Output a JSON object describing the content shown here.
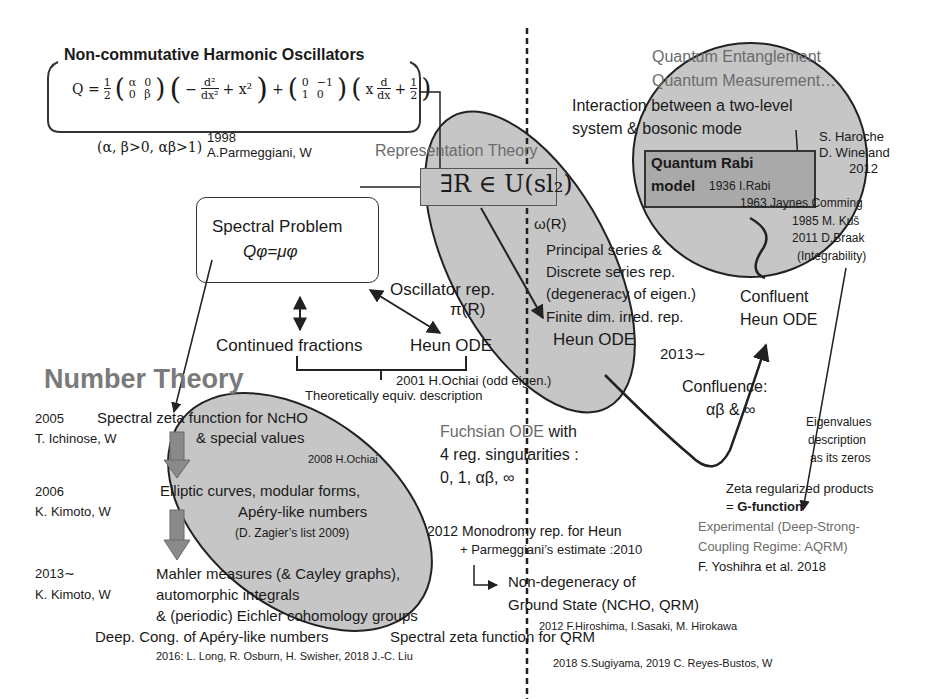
{
  "colors": {
    "ellipse_fill": "#c6c6c6",
    "rabi_box_fill": "#a9a9a9",
    "gray_text": "#6b6b6b",
    "number_theory_heading": "#7a7a7a",
    "down_arrow": "#8a8a8a",
    "line": "#222222"
  },
  "ncho": {
    "title": "Non-commutative Harmonic Oscillators",
    "formula": "Q = ½(α 0; 0 β)(−d²/dx² + x²) + (0 −1; 1 0)(x d/dx + ½)",
    "formula_q": "Q =",
    "formula_half": "1",
    "formula_half_den": "2",
    "matrix1": [
      "α",
      "0",
      "0",
      "β"
    ],
    "term1": "−",
    "term1_num": "d²",
    "term1_den": "dx²",
    "term1_tail": "+ x²",
    "plus": "+",
    "matrix2": [
      "0",
      "−1",
      "1",
      "0"
    ],
    "term2_x": "x",
    "term2_num": "d",
    "term2_den": "dx",
    "term2_plus": "+",
    "term2_half_num": "1",
    "term2_half_den": "2",
    "conditions": "(α, β>0, αβ>1)",
    "year": "1998",
    "authors": "A.Parmeggiani, W"
  },
  "representation": {
    "heading": "Representation Theory",
    "element": "∃R ∈ U(sl₂)",
    "omega": "ω(R)",
    "items": [
      "Principal series &",
      "Discrete series rep.",
      "(degeneracy of eigen.)",
      "Finite dim. irred. rep."
    ],
    "heun": "Heun ODE"
  },
  "spectral": {
    "title": "Spectral Problem",
    "equation": "Qφ=μφ",
    "oscillator_rep": "Oscillator rep.",
    "pi_r": "π(R)",
    "continued_fractions": "Continued fractions",
    "heun": "Heun ODE",
    "ochiai_2001": "2001 H.Ochiai (odd eigen.)",
    "equiv": "Theoretically equiv. description"
  },
  "quantum": {
    "entanglement": "Quantum Entanglement",
    "measurement": "Quantum Measurement…",
    "interaction_1": "Interaction between a two-level",
    "interaction_2": "system & bosonic mode",
    "nobel_1": "S. Haroche",
    "nobel_2": "D. Wineland",
    "nobel_year": "2012",
    "rabi_title_1": "Quantum Rabi",
    "rabi_title_2": "model",
    "rabi_1936": "1936 I.Rabi",
    "history": [
      "1963 Jaynes Comming",
      "1985 M. Kuš",
      "2011 D.Braak",
      "(Integrability)"
    ],
    "confluent_1": "Confluent",
    "confluent_2": "Heun ODE",
    "year_2013": "2013∼",
    "confluence_1": "Confluence:",
    "confluence_2": "αβ & ∞",
    "eigen_1": "Eigenvalues",
    "eigen_2": "description",
    "eigen_3": "as its zeros",
    "zeta_products": "Zeta regularized products",
    "g_function_prefix": "= ",
    "g_function": "G-function",
    "experimental_1": "Experimental (Deep-Strong-",
    "experimental_2": "Coupling Regime: AQRM)",
    "experimental_3": "F. Yoshihra et al. 2018"
  },
  "number_theory": {
    "heading": "Number Theory",
    "rows": [
      {
        "year": "2005",
        "authors": "T. Ichinose, W"
      },
      {
        "year": "2006",
        "authors": "K. Kimoto, W"
      },
      {
        "year": "2013∼",
        "authors": "K. Kimoto, W"
      }
    ],
    "zeta_1": "Spectral zeta function for NcHO",
    "zeta_2": "& special values",
    "ochiai_2008": "2008 H.Ochiai",
    "elliptic_1": "Elliptic curves, modular forms,",
    "elliptic_2": "Apéry-like numbers",
    "zagier": "(D. Zagier’s list 2009)",
    "mahler_1": "Mahler measures (& Cayley graphs),",
    "mahler_2": "automorphic integrals",
    "mahler_3": "& (periodic) Eichler cohomology groups",
    "deep_cong": "Deep. Cong. of Apéry-like numbers",
    "deep_cong_refs": "2016: L. Long, R. Osburn, H. Swisher, 2018  J.-C. Liu"
  },
  "fuchsian": {
    "title_gray": "Fuchsian ODE",
    "title_black": " with",
    "line_2": "4 reg. singularities :",
    "line_3": "0, 1, αβ, ∞",
    "monodromy": "2012 Monodromy rep. for Heun",
    "parmeggiani": "+ Parmeggiani’s  estimate :2010",
    "non_degeneracy_1": "Non-degeneracy of",
    "non_degeneracy_2": "Ground State (NCHO, QRM)",
    "hiroshima": "2012 F.Hiroshima, I.Sasaki, M. Hirokawa",
    "zeta_qrm": "Spectral zeta function for QRM",
    "sugiyama": "2018 S.Sugiyama, 2019  C. Reyes-Bustos, W"
  }
}
